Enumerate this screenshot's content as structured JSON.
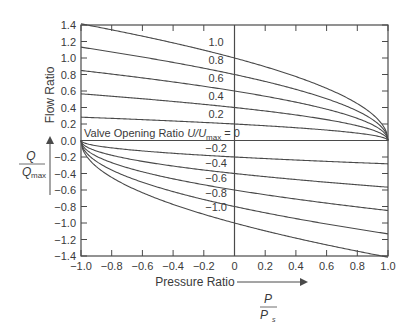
{
  "chart_data": {
    "type": "line",
    "title": "",
    "xlabel": "Pressure Ratio",
    "xlabel_fraction": {
      "numerator": "P",
      "denominator": "P",
      "denominator_sub": "s"
    },
    "ylabel": "Flow Ratio",
    "ylabel_fraction": {
      "numerator": "Q",
      "denominator": "Q",
      "denominator_sub": "max"
    },
    "xlim": [
      -1.0,
      1.0
    ],
    "ylim": [
      -1.4,
      1.4
    ],
    "x_ticks": [
      "-1.0",
      "-0.8",
      "-0.6",
      "-0.4",
      "-0.2",
      "0",
      "0.2",
      "0.4",
      "0.6",
      "0.8",
      "1.0"
    ],
    "y_ticks": [
      "1.4",
      "1.2",
      "1.0",
      "0.8",
      "0.6",
      "0.4",
      "0.2",
      "0.0",
      "-0.2",
      "-0.4",
      "-0.6",
      "-0.8",
      "-1.0",
      "-1.2",
      "-1.4"
    ],
    "grid": false,
    "legend": "none (curves labeled inline)",
    "annotation": "Valve Opening Ratio U/Umax = 0",
    "x": [
      -1.0,
      -0.8,
      -0.6,
      -0.4,
      -0.2,
      0.0,
      0.2,
      0.4,
      0.6,
      0.8,
      0.9,
      0.95,
      1.0
    ],
    "series": [
      {
        "name": "1.0",
        "values": [
          1.41,
          1.34,
          1.26,
          1.18,
          1.1,
          1.0,
          0.89,
          0.77,
          0.63,
          0.45,
          0.32,
          0.22,
          0.0
        ]
      },
      {
        "name": "0.8",
        "values": [
          1.13,
          1.07,
          1.01,
          0.95,
          0.88,
          0.8,
          0.72,
          0.62,
          0.51,
          0.36,
          0.25,
          0.18,
          0.0
        ]
      },
      {
        "name": "0.6",
        "values": [
          0.85,
          0.8,
          0.76,
          0.71,
          0.66,
          0.6,
          0.54,
          0.46,
          0.38,
          0.27,
          0.19,
          0.13,
          0.0
        ]
      },
      {
        "name": "0.4",
        "values": [
          0.57,
          0.54,
          0.51,
          0.47,
          0.44,
          0.4,
          0.36,
          0.31,
          0.25,
          0.18,
          0.13,
          0.09,
          0.0
        ]
      },
      {
        "name": "0.2",
        "values": [
          0.28,
          0.27,
          0.25,
          0.24,
          0.22,
          0.2,
          0.18,
          0.15,
          0.13,
          0.09,
          0.06,
          0.04,
          0.0
        ]
      },
      {
        "name": "-0.2",
        "values": [
          0.0,
          -0.09,
          -0.13,
          -0.15,
          -0.18,
          -0.2,
          -0.22,
          -0.24,
          -0.25,
          -0.27,
          -0.28,
          -0.28,
          -0.28
        ]
      },
      {
        "name": "-0.4",
        "values": [
          0.0,
          -0.18,
          -0.25,
          -0.31,
          -0.36,
          -0.4,
          -0.44,
          -0.47,
          -0.51,
          -0.54,
          -0.55,
          -0.56,
          -0.57
        ]
      },
      {
        "name": "-0.6",
        "values": [
          0.0,
          -0.27,
          -0.38,
          -0.46,
          -0.54,
          -0.6,
          -0.66,
          -0.71,
          -0.76,
          -0.8,
          -0.83,
          -0.84,
          -0.85
        ]
      },
      {
        "name": "-0.8",
        "values": [
          0.0,
          -0.36,
          -0.51,
          -0.62,
          -0.72,
          -0.8,
          -0.88,
          -0.95,
          -1.01,
          -1.07,
          -1.1,
          -1.12,
          -1.13
        ]
      },
      {
        "name": "-1.0",
        "values": [
          0.0,
          -0.45,
          -0.63,
          -0.77,
          -0.89,
          -1.0,
          -1.1,
          -1.18,
          -1.26,
          -1.34,
          -1.38,
          -1.4,
          -1.41
        ]
      }
    ],
    "curve_labels": [
      "1.0",
      "0.8",
      "0.6",
      "0.4",
      "0.2",
      "-0.2",
      "-0.4",
      "-0.6",
      "-0.8",
      "-1.0"
    ]
  },
  "labels": {
    "annotation_prefix": "Valve Opening Ratio ",
    "annotation_var": "U/U",
    "annotation_sub": "max",
    "annotation_suffix": " = 0"
  }
}
